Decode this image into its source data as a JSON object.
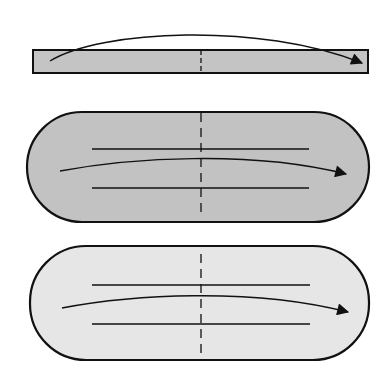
{
  "diagram": {
    "colors": {
      "background": "#ffffff",
      "stroke": "#111111",
      "strip_fill": "#c4c4c4",
      "dark_slab_fill": "#c2c2c2",
      "light_slab_fill": "#e6e6e6"
    },
    "panels": [
      {
        "id": "strip",
        "shape": "rectangle",
        "arrow": "arc-over-top",
        "centerline": "dashed"
      },
      {
        "id": "dark-slab",
        "shape": "rounded-pill",
        "guide_lines": 2,
        "arrow": "shallow-arc",
        "centerline": "dashed"
      },
      {
        "id": "light-slab",
        "shape": "rounded-pill",
        "guide_lines": 2,
        "arrow": "shallow-arc",
        "centerline": "dashed"
      }
    ]
  }
}
